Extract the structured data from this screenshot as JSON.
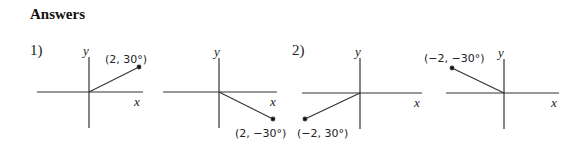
{
  "page": {
    "title": "Answers"
  },
  "problems": [
    {
      "number": "1)",
      "graphs": [
        {
          "point_label": "(2, 30°)",
          "x_axis": "x",
          "y_axis": "y"
        },
        {
          "point_label": "(2, −30°)",
          "x_axis": "x",
          "y_axis": "y"
        }
      ]
    },
    {
      "number": "2)",
      "graphs": [
        {
          "point_label": "(−2, 30°)",
          "x_axis": "x",
          "y_axis": "y"
        },
        {
          "point_label": "(−2, −30°)",
          "x_axis": "x",
          "y_axis": "y"
        }
      ]
    }
  ]
}
